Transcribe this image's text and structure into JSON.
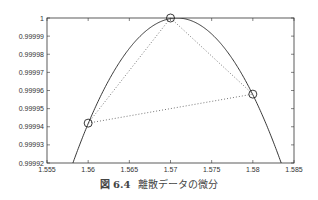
{
  "chart_data": {
    "type": "line",
    "title": "",
    "xlabel": "",
    "ylabel": "",
    "xlim": [
      1.555,
      1.585
    ],
    "ylim": [
      0.99992,
      1.0
    ],
    "grid": false,
    "x_ticks": [
      "1.555",
      "1.56",
      "1.565",
      "1.57",
      "1.575",
      "1.58",
      "1.585"
    ],
    "y_ticks": [
      "0.99992",
      "0.99993",
      "0.99994",
      "0.99995",
      "0.99996",
      "0.99997",
      "0.99998",
      "0.99999",
      "1"
    ],
    "series": [
      {
        "name": "sin(x)",
        "style": "solid",
        "function": "sin(x)"
      },
      {
        "name": "discrete points",
        "style": "circle-markers",
        "x": [
          1.56,
          1.57,
          1.58
        ],
        "y": [
          0.999942,
          1.0,
          0.999958
        ]
      },
      {
        "name": "secant lines",
        "style": "dotted",
        "segments": [
          [
            [
              1.56,
              0.999942
            ],
            [
              1.57,
              1.0
            ]
          ],
          [
            [
              1.57,
              1.0
            ],
            [
              1.58,
              0.999958
            ]
          ],
          [
            [
              1.56,
              0.999942
            ],
            [
              1.58,
              0.999958
            ]
          ]
        ]
      }
    ]
  },
  "caption": {
    "figure_label": "図 6.4",
    "text": "離散データの微分"
  }
}
